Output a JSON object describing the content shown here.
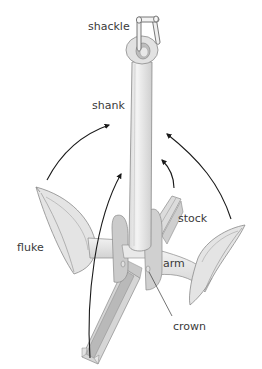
{
  "diagram": {
    "labels": {
      "shackle": "shackle",
      "shank": "shank",
      "stock": "stock",
      "fluke": "fluke",
      "arm": "arm",
      "crown": "crown"
    },
    "colors": {
      "background": "#ffffff",
      "body_light": "#ececec",
      "body_mid": "#d4d4d4",
      "body_dark": "#b5b5b5",
      "outline": "#8a8a8a",
      "arrow": "#1a1a1a",
      "label": "#3a3a3a"
    }
  }
}
